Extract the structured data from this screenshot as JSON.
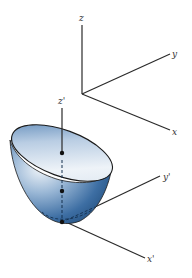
{
  "diagram": {
    "fixed_frame": {
      "origin": [
        82,
        94
      ],
      "axes": [
        {
          "name": "z",
          "label": "z",
          "end": [
            82,
            25
          ],
          "label_pos": [
            80,
            21
          ]
        },
        {
          "name": "y",
          "label": "y",
          "end": [
            170,
            54
          ],
          "label_pos": [
            173,
            56
          ]
        },
        {
          "name": "x",
          "label": "x",
          "end": [
            170,
            130
          ],
          "label_pos": [
            173,
            134
          ]
        }
      ]
    },
    "body_frame": {
      "axes": [
        {
          "name": "z-prime",
          "label": "z'",
          "label_pos": [
            58,
            104
          ]
        },
        {
          "name": "y-prime",
          "label": "y'",
          "label_pos": [
            163,
            180
          ]
        },
        {
          "name": "x-prime",
          "label": "x'",
          "label_pos": [
            147,
            262
          ]
        }
      ]
    },
    "surface": {
      "type": "paraboloid",
      "fill_light": "#e6eef6",
      "fill_mid": "#8fb0d2",
      "fill_dark": "#2f5f95",
      "rim_color": "#1a1a1a"
    },
    "points": [
      {
        "name": "upper-point",
        "pos": [
          62,
          153
        ]
      },
      {
        "name": "middle-point",
        "pos": [
          62,
          191
        ]
      },
      {
        "name": "vertex-point",
        "pos": [
          62,
          222
        ]
      }
    ]
  }
}
